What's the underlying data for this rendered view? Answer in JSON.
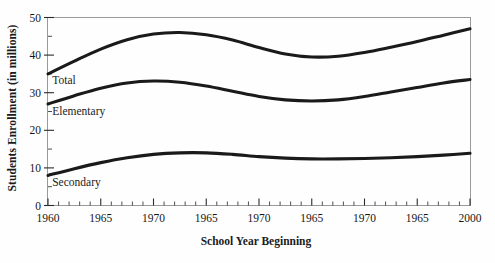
{
  "chart_data": {
    "type": "line",
    "title": "",
    "xlabel": "School Year Beginning",
    "ylabel": "Students Enrollment (in millions)",
    "ylim": [
      0,
      50
    ],
    "ytick_values": [
      0,
      10,
      20,
      30,
      40,
      50
    ],
    "ytick_labels": [
      "0",
      "10",
      "20",
      "30",
      "40",
      "50"
    ],
    "y_minor_step": 5,
    "x_minor_per_major": 5,
    "grid": false,
    "legend_position": "inline-labels",
    "xtick_labels": [
      "1960",
      "1965",
      "1970",
      "1965",
      "1970",
      "1965",
      "1970",
      "1965",
      "2000"
    ],
    "x_positions": [
      0,
      1,
      2,
      3,
      4,
      5,
      6,
      7,
      8
    ],
    "series": [
      {
        "name": "Total",
        "label": "Total",
        "color": "#1a1a1a",
        "x": [
          0,
          0.5,
          1,
          1.5,
          2,
          2.5,
          3,
          3.5,
          4,
          4.5,
          5,
          5.5,
          6,
          6.5,
          7,
          7.5,
          8
        ],
        "values": [
          35.0,
          38.4,
          41.6,
          44.1,
          45.6,
          46.0,
          45.4,
          44.0,
          42.0,
          40.3,
          39.5,
          39.7,
          40.7,
          42.1,
          43.6,
          45.3,
          47.0
        ]
      },
      {
        "name": "Elementary",
        "label": "Elementary",
        "color": "#1a1a1a",
        "x": [
          0,
          0.5,
          1,
          1.5,
          2,
          2.5,
          3,
          3.5,
          4,
          4.5,
          5,
          5.5,
          6,
          6.5,
          7,
          7.5,
          8
        ],
        "values": [
          27.0,
          29.2,
          31.2,
          32.6,
          33.1,
          32.8,
          31.8,
          30.4,
          29.0,
          28.1,
          27.8,
          28.1,
          29.0,
          30.2,
          31.4,
          32.6,
          33.5
        ]
      },
      {
        "name": "Secondary",
        "label": "Secondary",
        "color": "#1a1a1a",
        "x": [
          0,
          0.5,
          1,
          1.5,
          2,
          2.5,
          3,
          3.5,
          4,
          4.5,
          5,
          5.5,
          6,
          6.5,
          7,
          7.5,
          8
        ],
        "values": [
          8.0,
          9.8,
          11.4,
          12.7,
          13.6,
          14.0,
          14.0,
          13.6,
          13.0,
          12.6,
          12.4,
          12.4,
          12.5,
          12.7,
          13.0,
          13.4,
          13.9
        ]
      }
    ],
    "annotations": [
      {
        "text": "Total",
        "x": 0.08,
        "y": 32.3
      },
      {
        "text": "Elementary",
        "x": 0.08,
        "y": 24.2
      },
      {
        "text": "Secondary",
        "x": 0.08,
        "y": 5.3
      }
    ]
  }
}
